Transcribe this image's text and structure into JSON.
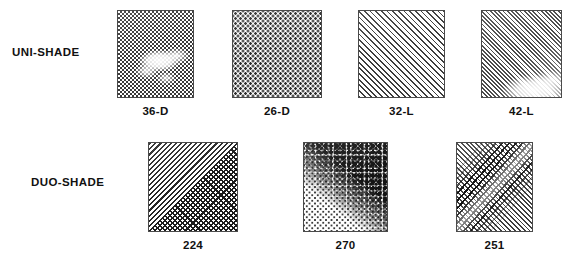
{
  "figure": {
    "background_color": "#ffffff",
    "ink_color": "#111111",
    "swatch_border_color": "#4a4a4a"
  },
  "rows": [
    {
      "label": "UNI-SHADE",
      "swatches": [
        {
          "caption": "36-D",
          "pattern": "fine-checkerboard-screen-with-light-cloud"
        },
        {
          "caption": "26-D",
          "pattern": "uniform-square-dot-grid"
        },
        {
          "caption": "32-L",
          "pattern": "diagonal-line-screen"
        },
        {
          "caption": "42-L",
          "pattern": "dense-diagonal-line-screen-with-light-wash"
        }
      ]
    },
    {
      "label": "DUO-SHADE",
      "swatches": [
        {
          "caption": "224",
          "pattern": "diagonal-lines-with-dark-crosshatch-triangle"
        },
        {
          "caption": "270",
          "pattern": "stipple-dots-with-dark-mottled-diagonal-band"
        },
        {
          "caption": "251",
          "pattern": "diagonal-lines-with-crossing-counter-diagonal-band"
        }
      ]
    }
  ]
}
